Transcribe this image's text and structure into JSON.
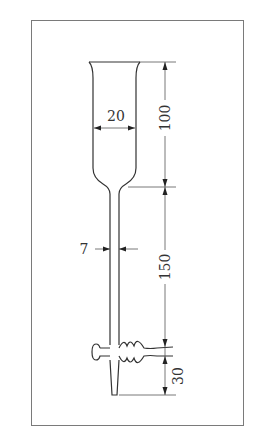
{
  "diagram": {
    "dimensions": {
      "cup_inner_width": "20",
      "cup_height": "100",
      "stem_width": "7",
      "stem_length": "150",
      "tip_length": "30"
    },
    "colors": {
      "line": "#333333",
      "frame": "#7a7a7a",
      "background": "#ffffff"
    }
  }
}
